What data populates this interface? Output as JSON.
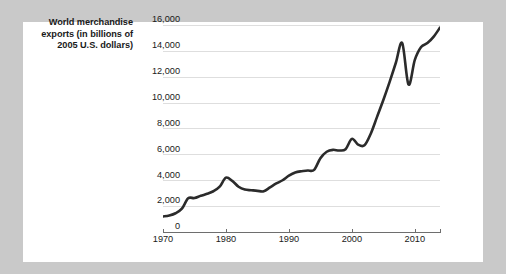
{
  "axis_label": {
    "line1": "World merchandise",
    "line2": "exports (in billions of",
    "line3": "2005 U.S. dollars)"
  },
  "colors": {
    "page_background": "#c9c9c9",
    "card_background": "#ffffff",
    "line": "#2b2b2b",
    "gridline": "#dedede",
    "axis": "#6e6e6e",
    "text": "#1a1a1a"
  },
  "chart_data": {
    "type": "line",
    "title": "",
    "xlabel": "",
    "ylabel": "World merchandise exports (in billions of 2005 U.S. dollars)",
    "xlim": [
      1970,
      2014
    ],
    "ylim": [
      0,
      16000
    ],
    "grid": true,
    "legend": "none",
    "ytick_labels": [
      "0",
      "2,000",
      "4,000",
      "6,000",
      "8,000",
      "10,000",
      "12,000",
      "14,000",
      "16,000"
    ],
    "ytick_values": [
      0,
      2000,
      4000,
      6000,
      8000,
      10000,
      12000,
      14000,
      16000
    ],
    "xtick_labels": [
      "1970",
      "1980",
      "1990",
      "2000",
      "2010"
    ],
    "xtick_values": [
      1970,
      1980,
      1990,
      2000,
      2010
    ],
    "series": [
      {
        "name": "World merchandise exports",
        "x": [
          1970,
          1971,
          1972,
          1973,
          1974,
          1975,
          1976,
          1977,
          1978,
          1979,
          1980,
          1981,
          1982,
          1983,
          1984,
          1985,
          1986,
          1987,
          1988,
          1989,
          1990,
          1991,
          1992,
          1993,
          1994,
          1995,
          1996,
          1997,
          1998,
          1999,
          2000,
          2001,
          2002,
          2003,
          2004,
          2005,
          2006,
          2007,
          2008,
          2009,
          2010,
          2011,
          2012,
          2013,
          2014
        ],
        "values": [
          1200,
          1280,
          1450,
          1800,
          2600,
          2620,
          2800,
          2950,
          3150,
          3500,
          4200,
          3950,
          3500,
          3280,
          3230,
          3180,
          3150,
          3450,
          3750,
          4000,
          4350,
          4600,
          4700,
          4750,
          4800,
          5700,
          6200,
          6350,
          6300,
          6400,
          7200,
          6750,
          6700,
          7600,
          8900,
          10200,
          11600,
          13100,
          14600,
          11400,
          13300,
          14300,
          14600,
          15100,
          15800
        ]
      }
    ]
  }
}
